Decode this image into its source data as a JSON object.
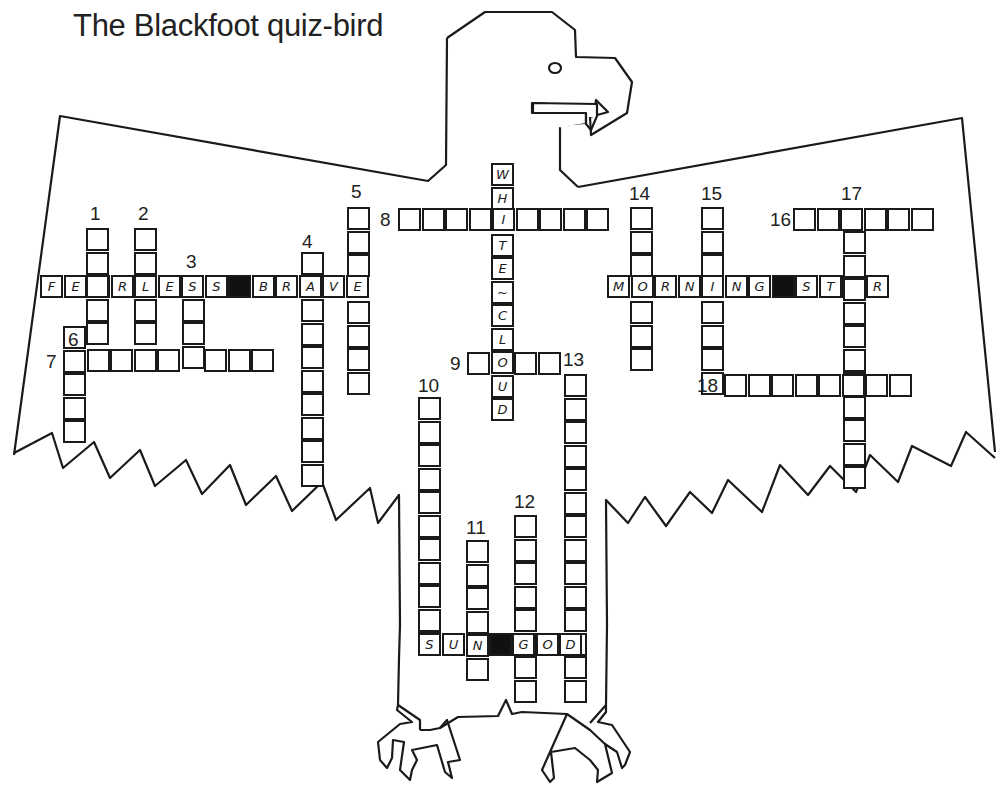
{
  "title": "The Blackfoot quiz-bird",
  "colors": {
    "ink": "#1a1a1a",
    "paper": "#ffffff",
    "black_cell": "#111111"
  },
  "cell_size": 23.5,
  "clue_numbers": [
    {
      "n": "1",
      "x": 90,
      "y": 204
    },
    {
      "n": "2",
      "x": 138,
      "y": 204
    },
    {
      "n": "3",
      "x": 186,
      "y": 252
    },
    {
      "n": "4",
      "x": 302,
      "y": 232
    },
    {
      "n": "5",
      "x": 351,
      "y": 182
    },
    {
      "n": "6",
      "x": 68,
      "y": 330
    },
    {
      "n": "7",
      "x": 46,
      "y": 352
    },
    {
      "n": "8",
      "x": 380,
      "y": 210
    },
    {
      "n": "9",
      "x": 450,
      "y": 354
    },
    {
      "n": "10",
      "x": 418,
      "y": 376
    },
    {
      "n": "11",
      "x": 466,
      "y": 518
    },
    {
      "n": "12",
      "x": 514,
      "y": 492
    },
    {
      "n": "13",
      "x": 563,
      "y": 350
    },
    {
      "n": "14",
      "x": 629,
      "y": 184
    },
    {
      "n": "15",
      "x": 701,
      "y": 184
    },
    {
      "n": "16",
      "x": 770,
      "y": 210
    },
    {
      "n": "17",
      "x": 841,
      "y": 184
    },
    {
      "n": "18",
      "x": 697,
      "y": 376
    }
  ],
  "entries": [
    {
      "id": "fearless-brave",
      "dir": "across",
      "x": 40,
      "y": 275,
      "letters": [
        "F",
        "E",
        "A",
        "R",
        "L",
        "E",
        "S",
        "S",
        "#",
        "B",
        "R",
        "A",
        "V",
        "E"
      ]
    },
    {
      "id": "1-down",
      "dir": "down",
      "x": 86,
      "y": 228,
      "letters": [
        "",
        "",
        "",
        "",
        ""
      ]
    },
    {
      "id": "2-down",
      "dir": "down",
      "x": 134,
      "y": 228,
      "letters": [
        "",
        "",
        "",
        "",
        ""
      ]
    },
    {
      "id": "3-down",
      "dir": "down",
      "x": 182,
      "y": 275,
      "letters": [
        "",
        "",
        "",
        ""
      ]
    },
    {
      "id": "4-down",
      "dir": "down",
      "x": 301,
      "y": 252,
      "letters": [
        "",
        "",
        "",
        "",
        "",
        "",
        "",
        "",
        "",
        ""
      ]
    },
    {
      "id": "5-down",
      "dir": "down",
      "x": 347,
      "y": 207,
      "letters": [
        "",
        "",
        "",
        "",
        "",
        "",
        "",
        ""
      ]
    },
    {
      "id": "6-down",
      "dir": "down",
      "x": 63,
      "y": 326,
      "letters": [
        "",
        "",
        "",
        "",
        ""
      ]
    },
    {
      "id": "7-across",
      "dir": "across",
      "x": 63,
      "y": 349,
      "letters": [
        "",
        "",
        "",
        "",
        "",
        "",
        "",
        "",
        ""
      ]
    },
    {
      "id": "8-across",
      "dir": "across",
      "x": 398,
      "y": 208,
      "letters": [
        "",
        "",
        "",
        "",
        "",
        "",
        "",
        "",
        ""
      ]
    },
    {
      "id": "white-cloud",
      "dir": "down",
      "x": 491,
      "y": 163,
      "letters": [
        "W",
        "H",
        "I",
        "T",
        "E",
        "~",
        "C",
        "L",
        "O",
        "U",
        "D"
      ]
    },
    {
      "id": "9-across",
      "dir": "across",
      "x": 467,
      "y": 352,
      "letters": [
        "",
        "",
        "",
        ""
      ]
    },
    {
      "id": "10-down",
      "dir": "down",
      "x": 418,
      "y": 397,
      "letters": [
        "",
        "",
        "",
        "",
        "",
        "",
        "",
        "",
        "",
        "",
        ""
      ]
    },
    {
      "id": "11-down",
      "dir": "down",
      "x": 466,
      "y": 540,
      "letters": [
        "",
        "",
        "",
        "",
        "",
        ""
      ]
    },
    {
      "id": "12-down",
      "dir": "down",
      "x": 514,
      "y": 515,
      "letters": [
        "",
        "",
        "",
        "",
        "",
        "",
        "",
        ""
      ]
    },
    {
      "id": "13-down",
      "dir": "down",
      "x": 564,
      "y": 374,
      "letters": [
        "",
        "",
        "",
        "",
        "",
        "",
        "",
        "",
        "",
        "",
        "",
        "",
        "",
        ""
      ]
    },
    {
      "id": "sun-god",
      "dir": "across",
      "x": 418,
      "y": 633,
      "letters": [
        "S",
        "U",
        "N",
        "#",
        "G",
        "O",
        "D"
      ]
    },
    {
      "id": "morning-star",
      "dir": "across",
      "x": 607,
      "y": 275,
      "letters": [
        "M",
        "O",
        "R",
        "N",
        "I",
        "N",
        "G",
        "#",
        "S",
        "T",
        "A",
        "R"
      ]
    },
    {
      "id": "14-down",
      "dir": "down",
      "x": 630,
      "y": 207,
      "letters": [
        "",
        "",
        "",
        "",
        "",
        "",
        ""
      ]
    },
    {
      "id": "15-down",
      "dir": "down",
      "x": 701,
      "y": 207,
      "letters": [
        "",
        "",
        "",
        "",
        "",
        "",
        "",
        ""
      ]
    },
    {
      "id": "16-across",
      "dir": "across",
      "x": 793,
      "y": 208,
      "letters": [
        "",
        "",
        "",
        "",
        "",
        ""
      ]
    },
    {
      "id": "17-down",
      "dir": "down",
      "x": 843,
      "y": 231,
      "letters": [
        "",
        "",
        "",
        "",
        "",
        "",
        "",
        "",
        "",
        "",
        ""
      ]
    },
    {
      "id": "18-across",
      "dir": "across",
      "x": 724,
      "y": 374,
      "letters": [
        "",
        "",
        "",
        "",
        "",
        "",
        "",
        ""
      ]
    }
  ]
}
